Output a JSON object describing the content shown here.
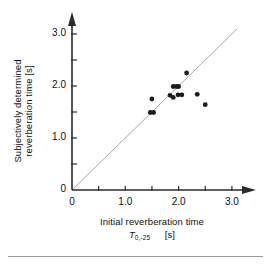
{
  "chart_data": {
    "type": "scatter",
    "title": "",
    "xlabel": "Initial reverberation time T0,-25 [s]",
    "xlabel_main": "Initial reverberation time",
    "xlabel_symbol": "T",
    "xlabel_subscript": "0,-25",
    "xlabel_unit": "[s]",
    "ylabel": "Subjectively determined reverberation time [s]",
    "ylabel_line1": "Subjectively determined",
    "ylabel_line2": "reverberation time   [s]",
    "xlim": [
      0,
      3.2
    ],
    "ylim": [
      0,
      3.2
    ],
    "xticks": [
      0,
      0.5,
      1.0,
      1.5,
      2.0,
      2.5,
      3.0
    ],
    "yticks": [
      0,
      0.5,
      1.0,
      1.5,
      2.0,
      2.5,
      3.0
    ],
    "xtick_labels": [
      "0",
      "",
      "1.0",
      "",
      "2.0",
      "",
      "3.0"
    ],
    "ytick_labels": [
      "0",
      "",
      "1.0",
      "",
      "2.0",
      "",
      "3.0"
    ],
    "grid": false,
    "legend": false,
    "reference_line": {
      "name": "identity-line",
      "slope": 1,
      "intercept": 0,
      "x_from": 0,
      "x_to": 3.1,
      "color": "#a9a9a9"
    },
    "marker": {
      "shape": "circle",
      "color": "#1a1a1a",
      "size_px": 4
    },
    "points": [
      {
        "x": 1.5,
        "y": 1.75
      },
      {
        "x": 1.47,
        "y": 1.49
      },
      {
        "x": 1.53,
        "y": 1.49
      },
      {
        "x": 1.84,
        "y": 1.82
      },
      {
        "x": 1.9,
        "y": 1.78
      },
      {
        "x": 1.9,
        "y": 1.99
      },
      {
        "x": 1.96,
        "y": 1.99
      },
      {
        "x": 2.0,
        "y": 1.99
      },
      {
        "x": 1.99,
        "y": 1.83
      },
      {
        "x": 2.06,
        "y": 1.83
      },
      {
        "x": 2.15,
        "y": 2.25
      },
      {
        "x": 2.35,
        "y": 1.84
      },
      {
        "x": 2.5,
        "y": 1.64
      }
    ]
  },
  "axes": {
    "x_axis_name": "x-axis",
    "y_axis_name": "y-axis",
    "arrowheads": true
  }
}
